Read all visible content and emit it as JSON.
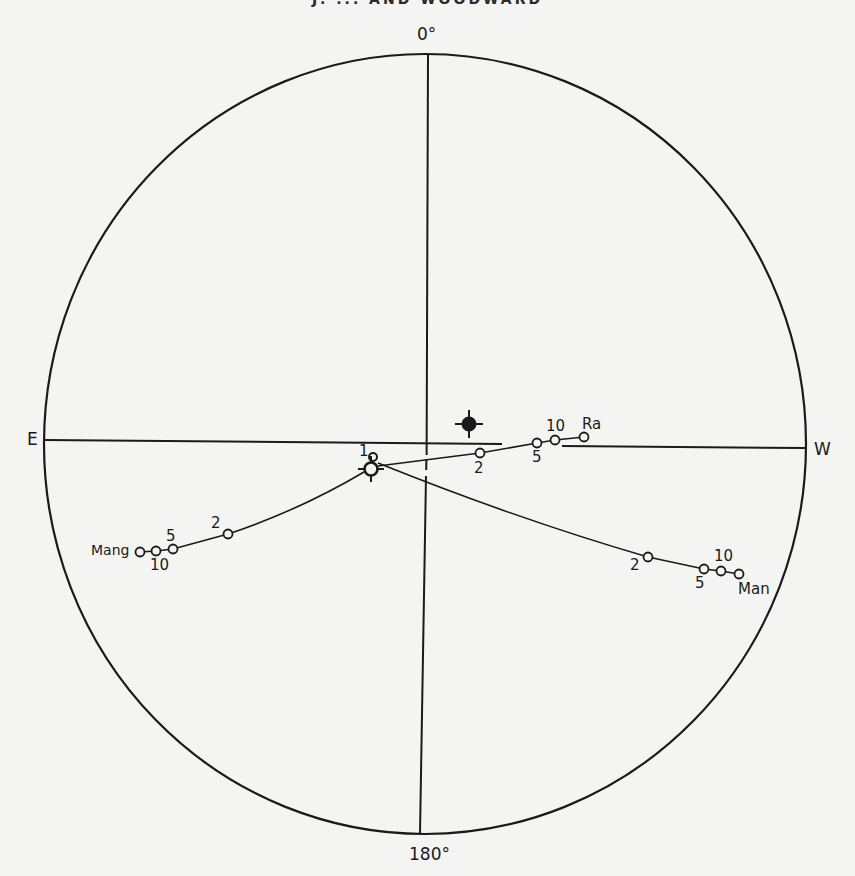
{
  "header": {
    "text": "J. ... AND WOODWARD"
  },
  "diagram": {
    "type": "polar projection plot",
    "axis_labels": {
      "top": "0°",
      "bottom": "180°",
      "left": "E",
      "right": "W"
    },
    "origin_labels": {
      "start": "1"
    },
    "paths": [
      {
        "name": "Ra",
        "points": [
          {
            "label": "2",
            "x": 480,
            "y": 453
          },
          {
            "label": "5",
            "x": 537,
            "y": 443
          },
          {
            "label": "10",
            "x": 555,
            "y": 440
          },
          {
            "label": "",
            "x": 584,
            "y": 437
          }
        ]
      },
      {
        "name": "Mang",
        "points": [
          {
            "label": "2",
            "x": 228,
            "y": 534
          },
          {
            "label": "5",
            "x": 173,
            "y": 549
          },
          {
            "label": "10",
            "x": 156,
            "y": 551
          },
          {
            "label": "",
            "x": 140,
            "y": 552
          }
        ]
      },
      {
        "name": "Man",
        "points": [
          {
            "label": "2",
            "x": 648,
            "y": 557
          },
          {
            "label": "5",
            "x": 704,
            "y": 569
          },
          {
            "label": "10",
            "x": 721,
            "y": 571
          },
          {
            "label": "",
            "x": 739,
            "y": 574
          }
        ]
      }
    ],
    "markers": [
      {
        "name": "filled-pole",
        "x": 469,
        "y": 424
      },
      {
        "name": "open-pole-start",
        "x": 371,
        "y": 469
      }
    ],
    "colors": {
      "ink": "#1a1a1a",
      "paper": "#f4f4f2"
    }
  }
}
